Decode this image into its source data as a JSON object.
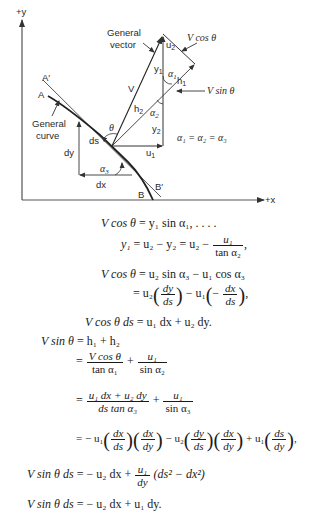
{
  "diagram": {
    "axes": {
      "y_label": "+y",
      "x_label": "+x"
    },
    "labels": {
      "general_vector": [
        "General",
        "vector"
      ],
      "general_curve": [
        "General",
        "curve"
      ],
      "v": "V",
      "v_cos_theta": "V cos θ",
      "v_sin_theta": "V sin θ",
      "u1": "u",
      "u1_sub": "1",
      "u2": "u",
      "u2_sub": "2",
      "y1": "y",
      "y1_sub": "1",
      "y2": "y",
      "y2_sub": "2",
      "h1": "h",
      "h1_sub": "1",
      "h2": "h",
      "h2_sub": "2",
      "alpha1": "α",
      "alpha1_sub": "1",
      "alpha2": "α",
      "alpha2_sub": "2",
      "alpha3": "α",
      "alpha3_sub": "3",
      "theta": "θ",
      "ds": "ds",
      "dx": "dx",
      "dy": "dy",
      "A": "A",
      "A_prime": "A′",
      "B": "B",
      "B_prime": "B′",
      "alpha_equality": "α₁ = α₂ = α₃"
    }
  },
  "equations": {
    "eq1": {
      "lhs": "V cos θ",
      "rhs": "= y₁ sin α₁, . . . ."
    },
    "eq2": {
      "lhs": "y₁",
      "mid": "= u₂ − y₂ = u₂ −",
      "frac_num": "u₁",
      "frac_den": "tan α₂",
      "tail": ","
    },
    "eq3": {
      "lhs": "V cos θ",
      "rhs": "= u₂ sin α₃ − u₁ cos α₃"
    },
    "eq4": {
      "a": "= u₂",
      "f1_num": "dy",
      "f1_den": "ds",
      "b": "− u₁",
      "c": "−",
      "f2_num": "dx",
      "f2_den": "ds",
      "tail": ","
    },
    "eq5": {
      "lhs": "V cos θ ds",
      "rhs": "= u₁ dx + u₂ dy."
    },
    "eq6": {
      "lhs": "V sin θ",
      "rhs": "= h₁ + h₂"
    },
    "eq7": {
      "a": "=",
      "f1_num": "V cos θ",
      "f1_den": "tan α₁",
      "b": "+",
      "f2_num": "u₁",
      "f2_den": "sin α₂"
    },
    "eq8": {
      "a": "=",
      "f1_num": "u₁ dx + u₂ dy",
      "f1_den": "ds tan α₃",
      "b": "+",
      "f2_num": "u₁",
      "f2_den": "sin α₃"
    },
    "eq9": {
      "a": "= − u₁",
      "f1_num": "dx",
      "f1_den": "ds",
      "f2_num": "dx",
      "f2_den": "dy",
      "b": "− u₂",
      "f3_num": "dy",
      "f3_den": "ds",
      "f4_num": "dx",
      "f4_den": "dy",
      "c": "+ u₁",
      "f5_num": "ds",
      "f5_den": "dy",
      "tail": ","
    },
    "eq10": {
      "lhs": "V sin θ ds",
      "a": "= − u₂ dx +",
      "f_num": "u₁",
      "f_den": "dy",
      "b": "(ds² − dx²)"
    },
    "eq11": {
      "lhs": "V sin θ ds",
      "rhs": "= − u₂ dx + u₁ dy."
    }
  }
}
